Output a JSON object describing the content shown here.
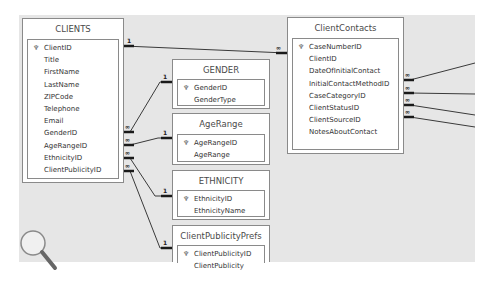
{
  "diagram": {
    "type": "relationships",
    "tables": [
      {
        "name": "CLIENTS",
        "primary_key": "ClientID",
        "fields": [
          "ClientID",
          "Title",
          "FirstName",
          "LastName",
          "ZIPCode",
          "Telephone",
          "Email",
          "GenderID",
          "AgeRangeID",
          "EthnicityID",
          "ClientPublicityID"
        ]
      },
      {
        "name": "GENDER",
        "primary_key": "GenderID",
        "fields": [
          "GenderID",
          "GenderType"
        ]
      },
      {
        "name": "AgeRange",
        "primary_key": "AgeRangeID",
        "fields": [
          "AgeRangeID",
          "AgeRange"
        ]
      },
      {
        "name": "ETHNICITY",
        "primary_key": "EthnicityID",
        "fields": [
          "EthnicityID",
          "EthnicityName"
        ]
      },
      {
        "name": "ClientPublicityPrefs",
        "primary_key": "ClientPublicityID",
        "fields": [
          "ClientPublicityID",
          "ClientPublicity"
        ]
      },
      {
        "name": "ClientContacts",
        "primary_key": "CaseNumberID",
        "fields": [
          "CaseNumberID",
          "ClientID",
          "DateOfInitialContact",
          "InitialContactMethodID",
          "CaseCategoryID",
          "ClientStatusID",
          "ClientSourceID",
          "NotesAboutContact"
        ]
      }
    ],
    "relationships": [
      {
        "from": "CLIENTS.ClientID",
        "to": "ClientContacts.ClientID",
        "one_label": "1",
        "many_label": "∞"
      },
      {
        "from": "GENDER.GenderID",
        "to": "CLIENTS.GenderID",
        "one_label": "1",
        "many_label": "∞"
      },
      {
        "from": "AgeRange.AgeRangeID",
        "to": "CLIENTS.AgeRangeID",
        "one_label": "1",
        "many_label": "∞"
      },
      {
        "from": "ETHNICITY.EthnicityID",
        "to": "CLIENTS.EthnicityID",
        "one_label": "1",
        "many_label": "∞"
      },
      {
        "from": "ClientPublicityPrefs.ClientPublicityID",
        "to": "CLIENTS.ClientPublicityID",
        "one_label": "1",
        "many_label": "∞"
      }
    ],
    "offscreen_relationships": [
      {
        "from": "ClientContacts.InitialContactMethodID",
        "many_label": "∞"
      },
      {
        "from": "ClientContacts.CaseCategoryID",
        "many_label": "∞"
      },
      {
        "from": "ClientContacts.ClientStatusID",
        "many_label": "∞"
      },
      {
        "from": "ClientContacts.ClientSourceID",
        "many_label": "∞"
      }
    ],
    "key_icon": "key-icon",
    "zoom_icon": "magnifier-icon",
    "colors": {
      "canvas": "#e6e6e6",
      "box_border": "#8a8a8a",
      "line": "#3a3a3a",
      "text": "#333333"
    }
  }
}
